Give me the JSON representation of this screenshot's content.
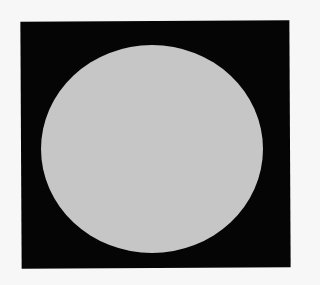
{
  "image": {
    "description": "Light gray circular disc on a black square background",
    "background_color": "#f7f7f7",
    "square_color": "#050505",
    "disc_color": "#c6c6c6"
  }
}
